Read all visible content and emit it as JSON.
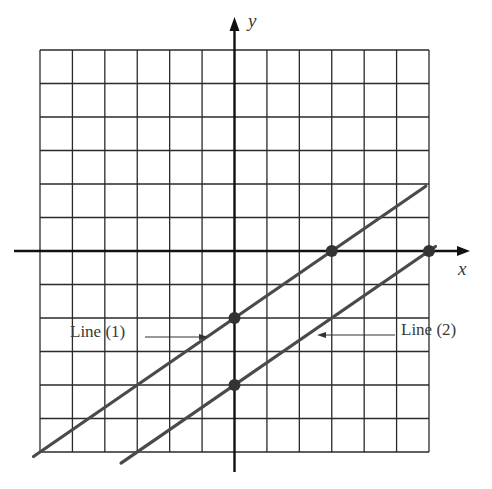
{
  "figure": {
    "type": "coordinate-grid-two-lines",
    "grid": {
      "x_min": -6,
      "x_max": 6,
      "y_min": -6,
      "y_max": 6,
      "step": 1
    },
    "axes": {
      "x_label": "x",
      "y_label": "y"
    },
    "colors": {
      "grid": "#2a2a2a",
      "axis": "#111111",
      "line": "#4a4a4a",
      "point": "#333333",
      "text": "#3a3a3a"
    }
  },
  "chart_data": {
    "type": "line",
    "title": "",
    "xlabel": "x",
    "ylabel": "y",
    "xlim": [
      -6,
      6
    ],
    "ylim": [
      -6,
      6
    ],
    "grid": true,
    "series": [
      {
        "name": "Line (1)",
        "slope": 0.6667,
        "y_intercept": -2,
        "x_intercept": 3,
        "marked_points": [
          [
            0,
            -2
          ],
          [
            3,
            0
          ]
        ],
        "x_range": [
          -6.2,
          5.9
        ]
      },
      {
        "name": "Line (2)",
        "slope": 0.6667,
        "y_intercept": -4,
        "x_intercept": 6,
        "marked_points": [
          [
            0,
            -4
          ],
          [
            6,
            0
          ]
        ],
        "x_range": [
          -3.5,
          6.2
        ]
      }
    ],
    "annotations": [
      {
        "text": "Line (1)",
        "arrow_to": "Line (1)"
      },
      {
        "text": "Line (2)",
        "arrow_to": "Line (2)"
      }
    ]
  },
  "labels": {
    "x_axis": "x",
    "y_axis": "y",
    "line1": "Line (1)",
    "line2": "Line (2)"
  }
}
